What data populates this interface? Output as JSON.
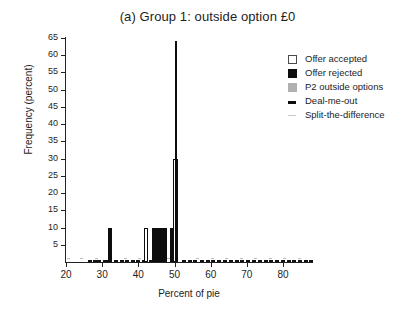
{
  "chart_data": {
    "type": "bar",
    "title": "(a) Group 1: outside option £0",
    "xlabel": "Percent of pie",
    "ylabel": "Frequency (percent)",
    "xlim": [
      20,
      88
    ],
    "ylim": [
      0,
      65
    ],
    "xticks": [
      20,
      30,
      40,
      50,
      60,
      70,
      80
    ],
    "yticks": [
      5,
      10,
      15,
      20,
      25,
      30,
      35,
      40,
      45,
      50,
      55,
      60,
      65
    ],
    "grid": false,
    "legend_position": "top-right",
    "legend": [
      {
        "label": "Offer accepted",
        "marker": "open-square",
        "color": "#ffffff"
      },
      {
        "label": "Offer rejected",
        "marker": "filled-square",
        "color": "#0d0d0d"
      },
      {
        "label": "P2 outside options",
        "marker": "gray-square",
        "color": "#b0b0b0"
      },
      {
        "label": "Deal-me-out",
        "marker": "dash",
        "color": "#0d0d0d"
      },
      {
        "label": "Split-the-difference",
        "marker": "light-dash",
        "color": "#c9c9c9"
      }
    ],
    "series": [
      {
        "name": "Offer accepted",
        "style": "open",
        "bars": [
          {
            "x": 41.6,
            "width": 1.1,
            "value": 10
          },
          {
            "x": 49.6,
            "width": 1.3,
            "value": 30
          }
        ]
      },
      {
        "name": "Offer rejected",
        "style": "filled",
        "bars": [
          {
            "x": 31.7,
            "width": 0.9,
            "value": 10
          },
          {
            "x": 43.8,
            "width": 4.2,
            "value": 10
          },
          {
            "x": 48.7,
            "width": 1.0,
            "value": 10
          }
        ]
      },
      {
        "name": "Deal-me-out spike",
        "style": "filled",
        "bars": [
          {
            "x": 50.1,
            "width": 0.35,
            "value": 64
          }
        ]
      }
    ],
    "baseline_markers": {
      "deal_me_out": [
        26.0,
        27.4,
        28.6,
        30.1,
        31.4,
        33.2,
        34.8,
        36.3,
        38.0,
        39.4,
        41.0,
        43.0,
        46.5,
        52.0,
        53.6,
        55.2,
        57.0,
        58.6,
        60.2,
        61.8,
        63.4,
        65.0,
        66.6,
        68.2,
        69.8,
        71.4,
        73.0,
        74.6,
        76.2,
        77.8,
        79.4,
        81.0,
        82.6,
        84.2,
        85.8,
        87.2
      ],
      "split_the_difference": [
        20.4,
        24.0,
        28.0,
        32.0,
        36.0,
        40.0,
        44.0,
        48.0,
        56.0,
        60.0,
        64.0,
        68.0,
        72.0,
        76.0,
        80.0,
        84.0
      ]
    }
  }
}
